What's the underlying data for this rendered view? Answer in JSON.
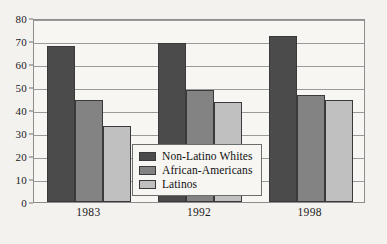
{
  "chart_data": {
    "type": "bar",
    "title": "",
    "subtitle": "",
    "xlabel": "",
    "ylabel": "",
    "categories": [
      "1983",
      "1992",
      "1998"
    ],
    "series": [
      {
        "name": "Non-Latino Whites",
        "color": "#4b4b4b",
        "values": [
          68,
          69,
          72
        ]
      },
      {
        "name": "African-Americans",
        "color": "#838383",
        "values": [
          44.5,
          48.5,
          46.5
        ]
      },
      {
        "name": "Latinos",
        "color": "#c0c0c0",
        "values": [
          33,
          43.5,
          44.5
        ]
      }
    ],
    "ylim": [
      0,
      80
    ],
    "ytick_values": [
      0,
      10,
      20,
      30,
      40,
      50,
      60,
      70,
      80
    ],
    "ytick_labels": [
      "0",
      "10",
      "20",
      "30",
      "40",
      "50",
      "60",
      "70",
      "80"
    ],
    "grid": true,
    "grid_axis": "y",
    "legend_position": "center",
    "background_color": "#f4f2ef",
    "plot_background_color": "#f7f6f3",
    "axis_color": "#8d8d8d",
    "gridline_color": "#9a9a9a"
  }
}
